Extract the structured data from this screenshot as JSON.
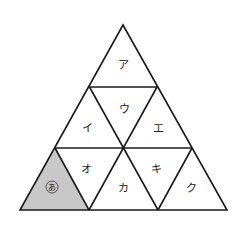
{
  "diagram": {
    "colors": {
      "line": "#1a1a1a",
      "shaded": "#c8c8c8",
      "background": "#ffffff"
    },
    "cells": [
      {
        "id": "a",
        "label": "ア",
        "shaded": false
      },
      {
        "id": "i",
        "label": "イ",
        "shaded": false
      },
      {
        "id": "u",
        "label": "ウ",
        "shaded": false
      },
      {
        "id": "e",
        "label": "エ",
        "shaded": false
      },
      {
        "id": "ah",
        "label": "あ",
        "shaded": true,
        "circled": true
      },
      {
        "id": "o",
        "label": "オ",
        "shaded": false
      },
      {
        "id": "ka",
        "label": "カ",
        "shaded": false
      },
      {
        "id": "ki",
        "label": "キ",
        "shaded": false
      },
      {
        "id": "ku",
        "label": "ク",
        "shaded": false
      }
    ]
  }
}
